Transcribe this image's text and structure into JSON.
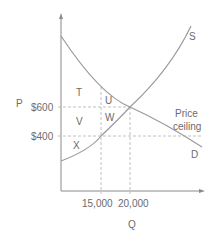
{
  "diagram": {
    "axis_labels": {
      "y": "P",
      "x": "Q"
    },
    "price_ticks": [
      {
        "label": "$600",
        "value": 600
      },
      {
        "label": "$400",
        "value": 400
      }
    ],
    "quantity_ticks": [
      {
        "label": "15,000",
        "value": 15000
      },
      {
        "label": "20,000",
        "value": 20000
      }
    ],
    "curves": {
      "supply": "S",
      "demand": "D"
    },
    "price_ceiling_label": [
      "Price",
      "ceiling"
    ],
    "regions": [
      "T",
      "U",
      "V",
      "W",
      "X"
    ],
    "colors": {
      "axis": "#8a8a8a",
      "curve": "#9a9a9a",
      "dashed": "#b0b0b0",
      "text": "#6b6b6b"
    }
  }
}
